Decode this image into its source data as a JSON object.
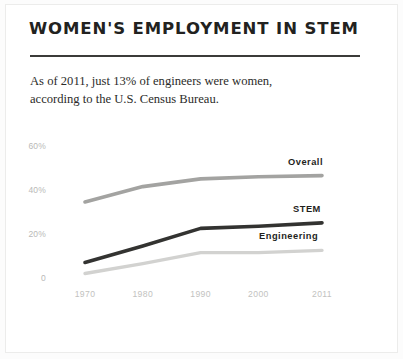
{
  "card": {
    "title": "WOMEN'S EMPLOYMENT IN STEM",
    "deck_line_1": "As of 2011, just 13% of engineers were women,",
    "deck_line_2": "according to the U.S. Census Bureau."
  },
  "chart_data": {
    "type": "line",
    "title": "WOMEN'S EMPLOYMENT IN STEM",
    "subtitle": "As of 2011, just 13% of engineers were women, according to the U.S. Census Bureau.",
    "xlabel": "",
    "ylabel": "",
    "x": [
      1970,
      1980,
      1990,
      2000,
      2011
    ],
    "categories": [
      "1970",
      "1980",
      "1990",
      "2000",
      "2011"
    ],
    "xtick_labels": [
      "1970",
      "1980",
      "1990",
      "2000",
      "2011"
    ],
    "ytick_labels": [
      "60%",
      "40%",
      "20%",
      "0"
    ],
    "ytick_values": [
      60,
      40,
      20,
      0
    ],
    "ylim": [
      0,
      65
    ],
    "xlim": [
      1970,
      2011
    ],
    "grid": false,
    "legend_position": "inline-right",
    "series": [
      {
        "name": "Overall",
        "color": "#a3a3a1",
        "values": [
          35,
          42,
          45.5,
          46.5,
          47
        ]
      },
      {
        "name": "STEM",
        "color": "#333331",
        "values": [
          7.5,
          15,
          23,
          24,
          25.5
        ]
      },
      {
        "name": "Engineering",
        "color": "#d2d2d0",
        "values": [
          2.5,
          7,
          12,
          12,
          13
        ]
      }
    ],
    "annotations": [
      {
        "label": "Overall",
        "series": "Overall"
      },
      {
        "label": "STEM",
        "series": "STEM"
      },
      {
        "label": "Engineering",
        "series": "Engineering"
      }
    ]
  },
  "colors": {
    "ink": "#222220",
    "rule": "#3b3b39",
    "overall": "#a3a3a1",
    "stem": "#333331",
    "engineering": "#d2d2d0",
    "tick": "#c2c2c0",
    "card_bg": "#ffffff",
    "page_bg": "#fcfcfc"
  }
}
